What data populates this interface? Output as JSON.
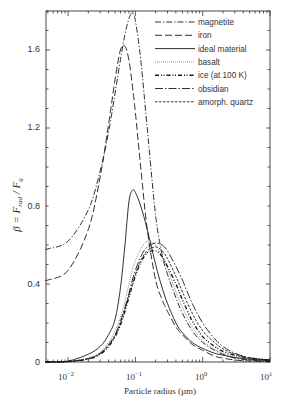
{
  "chart_data": {
    "type": "line",
    "title": "",
    "xlabel": "Particle radius (µm)",
    "ylabel": "β = F_rad / F_g",
    "xscale": "log",
    "xlim": [
      0.0047,
      10
    ],
    "ylim": [
      0,
      1.8
    ],
    "x_ticks": [
      "10^-2",
      "10^-1",
      "10^0",
      "10^1"
    ],
    "y_ticks": [
      "0",
      "0.4",
      "0.8",
      "1.2",
      "1.6"
    ],
    "grid": false,
    "legend_position": "upper right",
    "x": [
      0.005,
      0.01,
      0.02,
      0.03,
      0.04,
      0.05,
      0.06,
      0.07,
      0.08,
      0.09,
      0.1,
      0.12,
      0.15,
      0.2,
      0.25,
      0.3,
      0.4,
      0.5,
      0.7,
      1.0,
      1.5,
      2,
      3,
      5,
      10
    ],
    "series": [
      {
        "name": "magnetite",
        "style": "dash-dot",
        "values": [
          0.58,
          0.62,
          0.78,
          0.98,
          1.18,
          1.38,
          1.55,
          1.68,
          1.76,
          1.79,
          1.75,
          1.55,
          1.2,
          0.75,
          0.55,
          0.45,
          0.33,
          0.25,
          0.16,
          0.1,
          0.06,
          0.04,
          0.02,
          0.01,
          0.005
        ]
      },
      {
        "name": "iron",
        "style": "dashed-long",
        "values": [
          0.42,
          0.47,
          0.68,
          0.95,
          1.22,
          1.45,
          1.6,
          1.62,
          1.55,
          1.42,
          1.28,
          1.0,
          0.68,
          0.42,
          0.32,
          0.26,
          0.18,
          0.14,
          0.09,
          0.06,
          0.03,
          0.02,
          0.01,
          0.005,
          0.002
        ]
      },
      {
        "name": "ideal material",
        "style": "solid",
        "values": [
          0.0,
          0.005,
          0.04,
          0.08,
          0.14,
          0.22,
          0.38,
          0.6,
          0.82,
          0.88,
          0.87,
          0.8,
          0.68,
          0.5,
          0.38,
          0.3,
          0.2,
          0.15,
          0.1,
          0.07,
          0.045,
          0.035,
          0.023,
          0.014,
          0.007
        ]
      },
      {
        "name": "basalt",
        "style": "dotted-fine",
        "values": [
          0.0,
          0.003,
          0.02,
          0.05,
          0.1,
          0.16,
          0.23,
          0.31,
          0.4,
          0.47,
          0.52,
          0.58,
          0.62,
          0.6,
          0.54,
          0.48,
          0.36,
          0.28,
          0.18,
          0.11,
          0.065,
          0.045,
          0.028,
          0.016,
          0.008
        ]
      },
      {
        "name": "ice (at 100 K)",
        "style": "dash-dot-dot",
        "values": [
          0.0,
          0.002,
          0.015,
          0.04,
          0.08,
          0.13,
          0.19,
          0.26,
          0.33,
          0.39,
          0.44,
          0.51,
          0.56,
          0.57,
          0.54,
          0.49,
          0.4,
          0.32,
          0.21,
          0.13,
          0.08,
          0.055,
          0.035,
          0.02,
          0.01
        ]
      },
      {
        "name": "obsidian",
        "style": "dash-dot-long",
        "values": [
          0.0,
          0.002,
          0.018,
          0.045,
          0.09,
          0.14,
          0.21,
          0.28,
          0.35,
          0.42,
          0.47,
          0.54,
          0.59,
          0.61,
          0.6,
          0.57,
          0.49,
          0.42,
          0.3,
          0.2,
          0.12,
          0.08,
          0.045,
          0.022,
          0.01
        ]
      },
      {
        "name": "amorph. quartz",
        "style": "short-dashed",
        "values": [
          0.0,
          0.002,
          0.016,
          0.042,
          0.085,
          0.135,
          0.2,
          0.27,
          0.34,
          0.4,
          0.45,
          0.52,
          0.57,
          0.59,
          0.57,
          0.53,
          0.44,
          0.36,
          0.25,
          0.16,
          0.1,
          0.068,
          0.04,
          0.02,
          0.01
        ]
      }
    ]
  },
  "axes": {
    "xlabel": "Particle radius (µm)",
    "ylabel_beta": "β = F",
    "ylabel_sub1": "rad",
    "ylabel_mid": " / F",
    "ylabel_sub2": "g",
    "x_tick_labels": [
      {
        "base": "10",
        "exp": "−2"
      },
      {
        "base": "10",
        "exp": "−1"
      },
      {
        "base": "10",
        "exp": "0"
      },
      {
        "base": "10",
        "exp": "1"
      }
    ],
    "y_tick_labels": [
      "0",
      "0.4",
      "0.8",
      "1.2",
      "1.6"
    ]
  },
  "legend": {
    "items": [
      "magnetite",
      "iron",
      "ideal material",
      "basalt",
      "ice (at 100 K)",
      "obsidian",
      "amorph. quartz"
    ]
  },
  "colors": {
    "line": "#1a1a1a",
    "axis": "#333333",
    "background": "#ffffff"
  }
}
